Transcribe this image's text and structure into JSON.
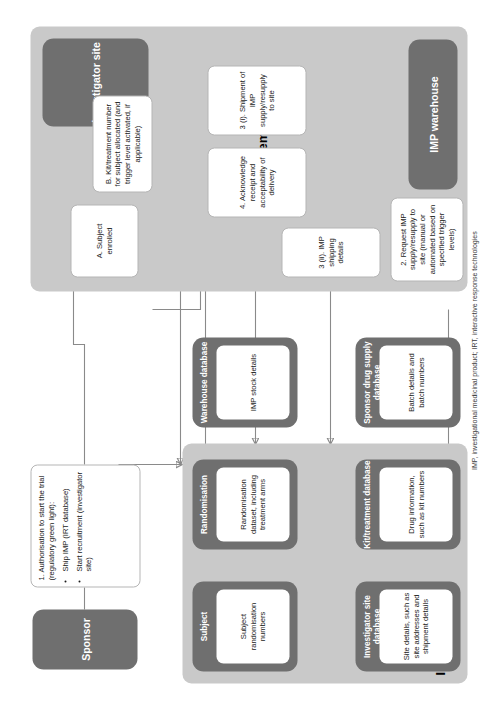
{
  "figure": {
    "footnote": "IMP, investigational medicinal product; IRT, interactive response technologies"
  },
  "entities": {
    "sponsor": "Sponsor",
    "investigator_site": "Investigator site",
    "imp_warehouse": "IMP warehouse"
  },
  "panels": {
    "irt": {
      "title": "IRT databases"
    },
    "imp": {
      "title": "IMP movement"
    }
  },
  "irt_databases": [
    {
      "name": "Subject",
      "detail": "Subject randomisation numbers"
    },
    {
      "name": "Randomisation",
      "detail": "Randomisation dataset, including treatment arms"
    },
    {
      "name": "Warehouse database",
      "detail": "IMP stock details"
    },
    {
      "name": "Investigator site database",
      "detail": "Site details, such as site addresses and shipment details"
    },
    {
      "name": "Kit/treatment database",
      "detail": "Drug information, such as kit numbers"
    },
    {
      "name": "Sponsor drug supply database",
      "detail": "Batch details and batch numbers"
    }
  ],
  "messages": {
    "authorisation_heading": "1. Authorisation to start the trial (regulatory green light):",
    "authorisation_bullets": [
      "Ship IMP (IRT database)",
      "Start recruitment (investigator site)"
    ],
    "subject_enrolled": "A. Subject enrolled",
    "kit_allocated": "B. Kit/treatment number for subject allocated (and trigger level activated, if applicable)",
    "request_supply": "2. Request IMP supply/resupply to site (manual or automated based on specified trigger levels)",
    "shipping_details": "3 (ii). IMP shipping details",
    "shipment": "3 (i). Shipment of IMP supply/resupply to site",
    "acknowledge": "4. Acknowledge receipt and acceptability of delivery"
  },
  "colors": {
    "entity_fill": "#6f6f6f",
    "panel_fill": "#c9c9c9",
    "card_fill": "#ffffff",
    "connector": "#8a8a8a"
  }
}
